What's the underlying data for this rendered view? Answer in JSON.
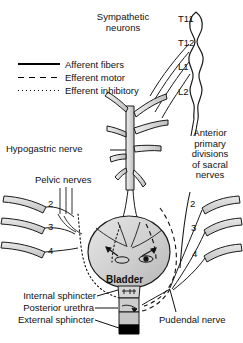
{
  "figure": {
    "title_text": "Innervation of the urinary bladder",
    "legend": [
      {
        "style": "solid",
        "label": "Afferent fibers"
      },
      {
        "style": "dashed",
        "label": "Efferent motor"
      },
      {
        "style": "dotted",
        "label": "Efferent inhibitory"
      }
    ],
    "labels": {
      "sympathetic_neurons": "Sympathetic\nneurons",
      "hypogastric_nerve": "Hypogastric nerve",
      "pelvic_nerves": "Pelvic nerves",
      "sacral_divisions": "Anterior\nprimary\ndivisions\nof sacral\nnerves",
      "bladder": "Bladder",
      "internal_sphincter": "Internal sphincter",
      "posterior_urethra": "Posterior urethra",
      "external_sphincter": "External sphincter",
      "pudendal_nerve": "Pudendal nerve"
    },
    "spinal_segments": [
      "T11",
      "T12",
      "L1",
      "L2"
    ],
    "sacral_roots_left": [
      "2",
      "3",
      "4"
    ],
    "sacral_roots_right": [
      "2",
      "3",
      "4"
    ],
    "colors": {
      "outline": "#1a1a1a",
      "nerve_fill": "#d9d9d9",
      "bladder_fill": "#c9c9c9",
      "bladder_fill_light": "#e2e2e2",
      "sphincter_black": "#000000",
      "background": "#ffffff"
    }
  }
}
